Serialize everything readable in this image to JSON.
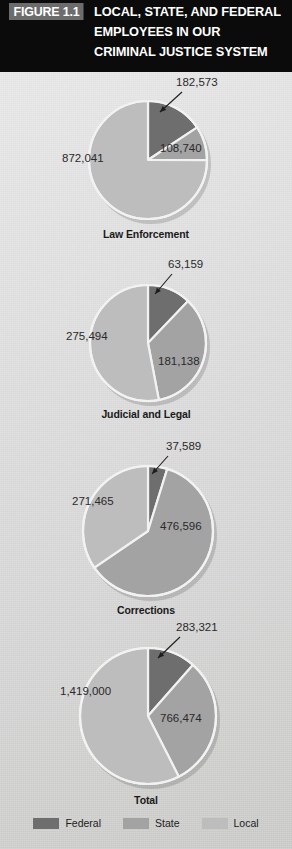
{
  "header": {
    "badge": "FIGURE 1.1",
    "title_lines": [
      "LOCAL, STATE, AND FEDERAL",
      "EMPLOYEES IN OUR",
      "CRIMINAL JUSTICE SYSTEM"
    ],
    "background": "#0b0b0b",
    "badge_background": "#6c6c6c",
    "text_color": "#ffffff"
  },
  "colors": {
    "federal": "#6e6e6e",
    "state": "#a3a3a3",
    "local": "#bdbdbd",
    "slice_border": "#f2f2f2",
    "page_background": "#dcdcdc",
    "label_text": "#2a2a2a"
  },
  "legend": {
    "items": [
      {
        "label": "Federal",
        "color": "#6e6e6e",
        "swatch": "federal-swatch"
      },
      {
        "label": "State",
        "color": "#a3a3a3",
        "swatch": "state-swatch"
      },
      {
        "label": "Local",
        "color": "#bdbdbd",
        "swatch": "local-swatch"
      }
    ]
  },
  "chart_data": [
    {
      "type": "pie",
      "title": "Law Enforcement",
      "categories": [
        "Federal",
        "State",
        "Local"
      ],
      "values": [
        182573,
        108740,
        872041
      ],
      "labels": [
        "182,573",
        "108,740",
        "872,041"
      ],
      "colors": [
        "#6e6e6e",
        "#a3a3a3",
        "#bdbdbd"
      ],
      "has_callout": true,
      "callout_for": "Federal"
    },
    {
      "type": "pie",
      "title": "Judicial and Legal",
      "categories": [
        "Federal",
        "State",
        "Local"
      ],
      "values": [
        63159,
        181138,
        275494
      ],
      "labels": [
        "63,159",
        "181,138",
        "275,494"
      ],
      "colors": [
        "#6e6e6e",
        "#a3a3a3",
        "#bdbdbd"
      ],
      "has_callout": true,
      "callout_for": "Federal"
    },
    {
      "type": "pie",
      "title": "Corrections",
      "categories": [
        "Federal",
        "State",
        "Local"
      ],
      "values": [
        37589,
        476596,
        271465
      ],
      "labels": [
        "37,589",
        "476,596",
        "271,465"
      ],
      "colors": [
        "#6e6e6e",
        "#a3a3a3",
        "#bdbdbd"
      ],
      "has_callout": true,
      "callout_for": "Federal"
    },
    {
      "type": "pie",
      "title": "Total",
      "categories": [
        "Federal",
        "State",
        "Local"
      ],
      "values": [
        283321,
        766474,
        1419000
      ],
      "labels": [
        "283,321",
        "766,474",
        "1,419,000"
      ],
      "colors": [
        "#6e6e6e",
        "#a3a3a3",
        "#bdbdbd"
      ],
      "has_callout": true,
      "callout_for": "Federal"
    }
  ],
  "geometry": {
    "charts": [
      {
        "cx": 148,
        "cy": 160,
        "r": 59,
        "title_y": 228,
        "label_pos": [
          {
            "x": 176,
            "y": 76,
            "align": "left"
          },
          {
            "x": 160,
            "y": 142,
            "align": "left"
          },
          {
            "x": 62,
            "y": 152,
            "align": "left"
          }
        ],
        "callout": {
          "x1": 182,
          "y1": 92,
          "x2": 160,
          "y2": 112
        }
      },
      {
        "cx": 148,
        "cy": 343,
        "r": 58,
        "title_y": 408,
        "label_pos": [
          {
            "x": 168,
            "y": 258,
            "align": "left"
          },
          {
            "x": 158,
            "y": 355,
            "align": "left"
          },
          {
            "x": 66,
            "y": 330,
            "align": "left"
          }
        ],
        "callout": {
          "x1": 172,
          "y1": 274,
          "x2": 155,
          "y2": 294
        }
      },
      {
        "cx": 148,
        "cy": 531,
        "r": 65,
        "title_y": 604,
        "label_pos": [
          {
            "x": 166,
            "y": 440,
            "align": "left"
          },
          {
            "x": 160,
            "y": 520,
            "align": "left"
          },
          {
            "x": 72,
            "y": 495,
            "align": "left"
          }
        ],
        "callout": {
          "x1": 168,
          "y1": 456,
          "x2": 152,
          "y2": 474
        }
      },
      {
        "cx": 148,
        "cy": 716,
        "r": 68,
        "title_y": 794,
        "label_pos": [
          {
            "x": 176,
            "y": 621,
            "align": "left"
          },
          {
            "x": 160,
            "y": 712,
            "align": "left"
          },
          {
            "x": 60,
            "y": 685,
            "align": "left"
          }
        ],
        "callout": {
          "x1": 180,
          "y1": 637,
          "x2": 158,
          "y2": 658
        }
      }
    ]
  }
}
